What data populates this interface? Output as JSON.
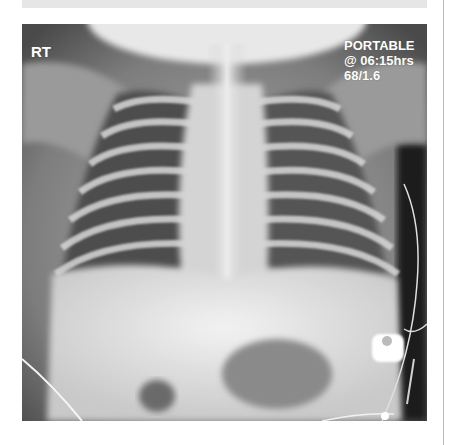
{
  "image": {
    "subject": "neonatal chest x-ray (AP)",
    "overlay": {
      "side_marker": "RT",
      "lines": [
        "PORTABLE",
        "@ 06:15hrs",
        "68/1.6"
      ]
    }
  },
  "colors": {
    "background": "#ffffff",
    "top_bar": "#e6e6e6",
    "divider": "#bdbdbd",
    "overlay_text": "#ffffff"
  }
}
